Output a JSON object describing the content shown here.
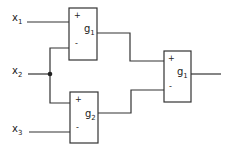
{
  "diagram": {
    "type": "block-diagram",
    "inputs": [
      {
        "id": "x1",
        "base": "x",
        "sub": "1"
      },
      {
        "id": "x2",
        "base": "x",
        "sub": "2"
      },
      {
        "id": "x3",
        "base": "x",
        "sub": "3"
      }
    ],
    "blocks": [
      {
        "id": "top",
        "base": "g",
        "sub": "1",
        "plus": "+",
        "minus": "-"
      },
      {
        "id": "bottom",
        "base": "g",
        "sub": "2",
        "plus": "+",
        "minus": "-"
      },
      {
        "id": "right",
        "base": "g",
        "sub": "1",
        "plus": "+",
        "minus": "-"
      }
    ],
    "connections": [
      "x1 -> top(+)",
      "x2 -> top(-)",
      "x2 -> bottom(+)",
      "x3 -> bottom(-)",
      "top -> right(+)",
      "bottom -> right(-)"
    ],
    "line_color": "#333333"
  }
}
